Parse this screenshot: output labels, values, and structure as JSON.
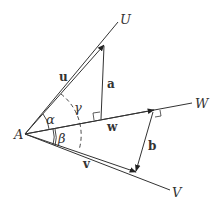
{
  "diagram": {
    "points": {
      "A": {
        "label": "A",
        "x": 25,
        "y": 134
      },
      "U": {
        "label": "U",
        "x": 118,
        "y": 22
      },
      "W": {
        "label": "W",
        "x": 192,
        "y": 103
      },
      "V": {
        "label": "V",
        "x": 170,
        "y": 190
      }
    },
    "vectors": {
      "u": {
        "label": "u"
      },
      "v": {
        "label": "v"
      },
      "w": {
        "label": "w"
      },
      "a": {
        "label": "a"
      },
      "b": {
        "label": "b"
      }
    },
    "angles": {
      "alpha": {
        "label": "α"
      },
      "beta": {
        "label": "β"
      },
      "gamma": {
        "label": "γ"
      }
    },
    "colors": {
      "line": "#333333",
      "background": "#ffffff"
    }
  }
}
